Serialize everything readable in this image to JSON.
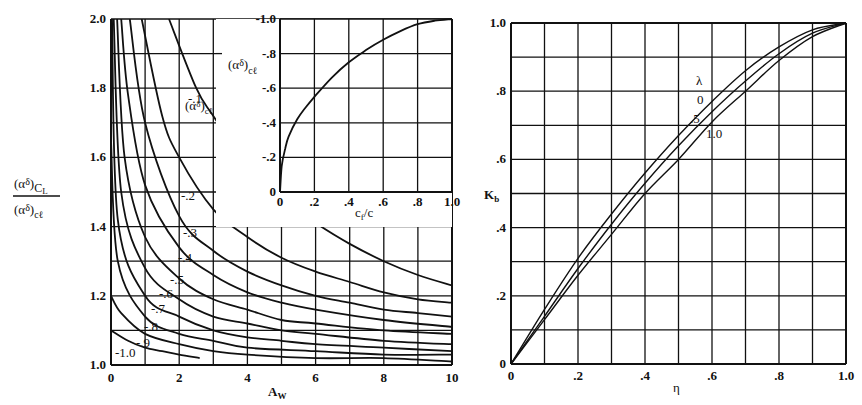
{
  "chart_data": [
    {
      "id": "left-main",
      "type": "line",
      "title": "",
      "xlabel": "A_W",
      "ylabel": "(αδ)CL / (αδ)cl",
      "xlim": [
        0,
        10
      ],
      "ylim": [
        1.0,
        2.0
      ],
      "xticks": [
        "0",
        "2",
        "4",
        "6",
        "8",
        "10"
      ],
      "yticks": [
        "1.0",
        "1.2",
        "1.4",
        "1.6",
        "1.8",
        "2.0"
      ],
      "grid": true,
      "legend_title": "(αδ)cl",
      "series": [
        {
          "name": "-.1",
          "x": [
            1.7,
            2.5,
            3,
            4,
            5,
            6,
            7,
            8,
            9,
            10
          ],
          "values": [
            2.0,
            1.8,
            1.72,
            1.58,
            1.48,
            1.41,
            1.35,
            1.3,
            1.26,
            1.23
          ]
        },
        {
          "name": "-.2",
          "x": [
            0.9,
            1.5,
            2,
            3,
            4,
            5,
            6,
            7,
            8,
            9,
            10
          ],
          "values": [
            2.0,
            1.72,
            1.6,
            1.45,
            1.37,
            1.31,
            1.27,
            1.24,
            1.21,
            1.19,
            1.18
          ]
        },
        {
          "name": "-.3",
          "x": [
            0.55,
            1,
            2,
            3,
            4,
            5,
            6,
            7,
            8,
            9,
            10
          ],
          "values": [
            2.0,
            1.7,
            1.43,
            1.33,
            1.27,
            1.23,
            1.2,
            1.18,
            1.16,
            1.15,
            1.14
          ]
        },
        {
          "name": "-.4",
          "x": [
            0.3,
            0.5,
            1,
            2,
            3,
            4,
            5,
            6,
            8,
            10
          ],
          "values": [
            2.0,
            1.78,
            1.52,
            1.34,
            1.26,
            1.21,
            1.18,
            1.16,
            1.13,
            1.11
          ]
        },
        {
          "name": "-.5",
          "x": [
            0.18,
            0.4,
            1,
            2,
            3,
            4,
            5,
            6,
            8,
            10
          ],
          "values": [
            2.0,
            1.6,
            1.37,
            1.25,
            1.19,
            1.16,
            1.13,
            1.12,
            1.1,
            1.09
          ]
        },
        {
          "name": "-.6",
          "x": [
            0.08,
            0.3,
            1,
            2,
            3,
            4,
            5,
            6,
            8,
            10
          ],
          "values": [
            2.0,
            1.5,
            1.28,
            1.19,
            1.14,
            1.12,
            1.1,
            1.09,
            1.07,
            1.06
          ]
        },
        {
          "name": "-.7",
          "x": [
            0.03,
            0.2,
            1,
            2,
            3,
            4,
            5,
            6,
            8,
            10
          ],
          "values": [
            2.0,
            1.42,
            1.2,
            1.14,
            1.1,
            1.08,
            1.07,
            1.06,
            1.05,
            1.04
          ]
        },
        {
          "name": "-.8",
          "x": [
            0.0,
            0.2,
            1,
            2,
            3,
            4,
            6,
            8,
            10
          ],
          "values": [
            1.65,
            1.3,
            1.14,
            1.09,
            1.07,
            1.05,
            1.04,
            1.03,
            1.03
          ]
        },
        {
          "name": "-.9",
          "x": [
            0.0,
            0.3,
            1,
            2,
            3,
            4,
            6,
            8,
            10
          ],
          "values": [
            1.2,
            1.15,
            1.09,
            1.06,
            1.04,
            1.03,
            1.02,
            1.02,
            1.01
          ]
        },
        {
          "name": "-1.0",
          "x": [
            0.0,
            0.5,
            1,
            1.5,
            2,
            2.6
          ],
          "values": [
            1.1,
            1.07,
            1.05,
            1.04,
            1.03,
            1.02
          ]
        }
      ]
    },
    {
      "id": "left-inset",
      "type": "line",
      "title": "",
      "xlabel": "cf/c",
      "ylabel": "(αδ)cl",
      "xlim": [
        0,
        1.0
      ],
      "ylim": [
        0,
        -1.0
      ],
      "xticks": [
        "0",
        ".2",
        ".4",
        ".6",
        ".8",
        "1.0"
      ],
      "yticks": [
        "0",
        "-.2",
        "-.4",
        "-.6",
        "-.8",
        "-1.0"
      ],
      "grid": true,
      "series": [
        {
          "name": "(αδ)cl",
          "x": [
            0,
            0.01,
            0.03,
            0.05,
            0.1,
            0.15,
            0.2,
            0.3,
            0.4,
            0.5,
            0.6,
            0.7,
            0.8,
            0.9,
            1.0
          ],
          "values": [
            0,
            -0.15,
            -0.25,
            -0.32,
            -0.42,
            -0.49,
            -0.55,
            -0.66,
            -0.75,
            -0.82,
            -0.88,
            -0.93,
            -0.97,
            -0.99,
            -1.0
          ]
        }
      ]
    },
    {
      "id": "right",
      "type": "line",
      "title": "",
      "xlabel": "η",
      "ylabel": "K_b",
      "xlim": [
        0,
        1.0
      ],
      "ylim": [
        0,
        1.0
      ],
      "xticks": [
        "0",
        ".2",
        ".4",
        ".6",
        ".8",
        "1.0"
      ],
      "yticks": [
        "0",
        ".2",
        ".4",
        ".6",
        ".8",
        "1.0"
      ],
      "grid": true,
      "legend_title": "λ",
      "series": [
        {
          "name": "0",
          "x": [
            0,
            0.1,
            0.2,
            0.3,
            0.4,
            0.5,
            0.6,
            0.7,
            0.8,
            0.9,
            1.0
          ],
          "values": [
            0,
            0.16,
            0.31,
            0.44,
            0.56,
            0.67,
            0.77,
            0.86,
            0.93,
            0.98,
            1.0
          ]
        },
        {
          "name": ".5",
          "x": [
            0,
            0.1,
            0.2,
            0.3,
            0.4,
            0.5,
            0.6,
            0.7,
            0.8,
            0.9,
            1.0
          ],
          "values": [
            0,
            0.14,
            0.28,
            0.41,
            0.53,
            0.64,
            0.74,
            0.83,
            0.91,
            0.97,
            1.0
          ]
        },
        {
          "name": "1.0",
          "x": [
            0,
            0.1,
            0.2,
            0.3,
            0.4,
            0.5,
            0.6,
            0.7,
            0.8,
            0.9,
            1.0
          ],
          "values": [
            0,
            0.13,
            0.26,
            0.38,
            0.5,
            0.6,
            0.71,
            0.8,
            0.89,
            0.96,
            1.0
          ]
        }
      ]
    }
  ],
  "labels": {
    "left_ylabel_num_main": "(α",
    "left_ylabel_num_sub": "δ",
    "left_ylabel_num_suffix": ")",
    "left_ylabel_num_subscript": "C",
    "left_ylabel_num_subsub": "L",
    "left_ylabel_den_main": "(α",
    "left_ylabel_den_sub": "δ",
    "left_ylabel_den_suffix": ")",
    "left_ylabel_den_subscript": "cℓ",
    "left_xlabel_main": "A",
    "left_xlabel_sub": "W",
    "legend_title_main": "(α",
    "legend_title_sub": "δ",
    "legend_title_suffix": ")",
    "legend_title_subscript": "cℓ",
    "inset_ylabel_main": "(α",
    "inset_ylabel_sub": "δ",
    "inset_ylabel_suffix": ")",
    "inset_ylabel_subscript": "cℓ",
    "inset_xlabel_c": "c",
    "inset_xlabel_f": "f",
    "inset_xlabel_rest": "/c",
    "right_ylabel_main": "K",
    "right_ylabel_sub": "b",
    "right_xlabel": "η",
    "right_legend_title": "λ",
    "right_legend_0": "0",
    "right_legend_5": ".5",
    "right_legend_10": "1.0",
    "curve_labels": [
      "-.1",
      "-.2",
      "-.3",
      "-.4",
      "-.5",
      "-.6",
      "-.7",
      "-.8",
      "-.9",
      "-1.0"
    ]
  }
}
